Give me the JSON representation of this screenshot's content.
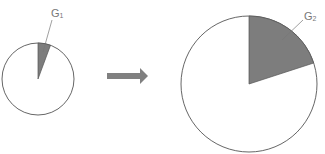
{
  "small_pie": {
    "label_main": "G",
    "label_sub": "1",
    "sector_fraction": 0.055
  },
  "big_pie": {
    "label_main": "G",
    "label_sub": "2",
    "sector_fraction": 0.2
  },
  "colors": {
    "sector_fill": "#7d7d7d",
    "outline": "#555555",
    "arrow": "#808080",
    "label": "#777777"
  }
}
